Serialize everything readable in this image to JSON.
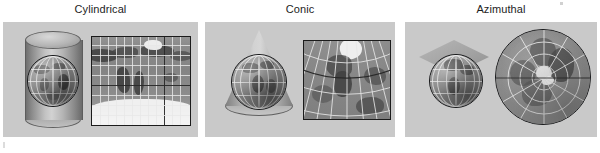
{
  "figure": {
    "width": 600,
    "height": 153,
    "background_color": "#ffffff",
    "panel_background_color": "#c9c9c9",
    "label_color": "#1d1d1d",
    "graticule_color": "#e8e8e8",
    "map_border_color": "#1b1b1b"
  },
  "panels": [
    {
      "id": "cylindrical",
      "label": "Cylindrical",
      "solid_name": "cylinder",
      "map_name": "world-cylindrical-map",
      "globe_name": "globe-in-cylinder",
      "map_description": "Full world map in cylindrical (Mercator-like) projection with rectangular graticule, dark equator and prime meridian lines, Antarctica as white band along the bottom",
      "grid": {
        "type": "rectangular",
        "vertical_lines": 12,
        "horizontal_lines": 8,
        "major_vertical_index": 8,
        "major_horizontal_index": 4
      }
    },
    {
      "id": "conic",
      "label": "Conic",
      "solid_name": "cone",
      "map_name": "northern-hemisphere-conic-map",
      "globe_name": "globe-in-cone",
      "map_description": "North America and north Atlantic in conic projection; graticule meridians fan out from a point above the frame, parallels are concentric arcs, Greenland appears white at top",
      "grid": {
        "type": "fan",
        "meridians": 11,
        "parallels": 5,
        "major_parallel_index": 2
      }
    },
    {
      "id": "azimuthal",
      "label": "Azimuthal",
      "solid_name": "plane",
      "map_name": "polar-azimuthal-map",
      "globe_name": "globe-under-plane",
      "map_description": "Polar azimuthal (north polar) projection in a circle; radial meridians converge at the pole, parallels are concentric circles, white ice cap near the center",
      "grid": {
        "type": "radial",
        "meridians": 12,
        "parallels": 4,
        "major_meridian_index": 0
      }
    }
  ]
}
